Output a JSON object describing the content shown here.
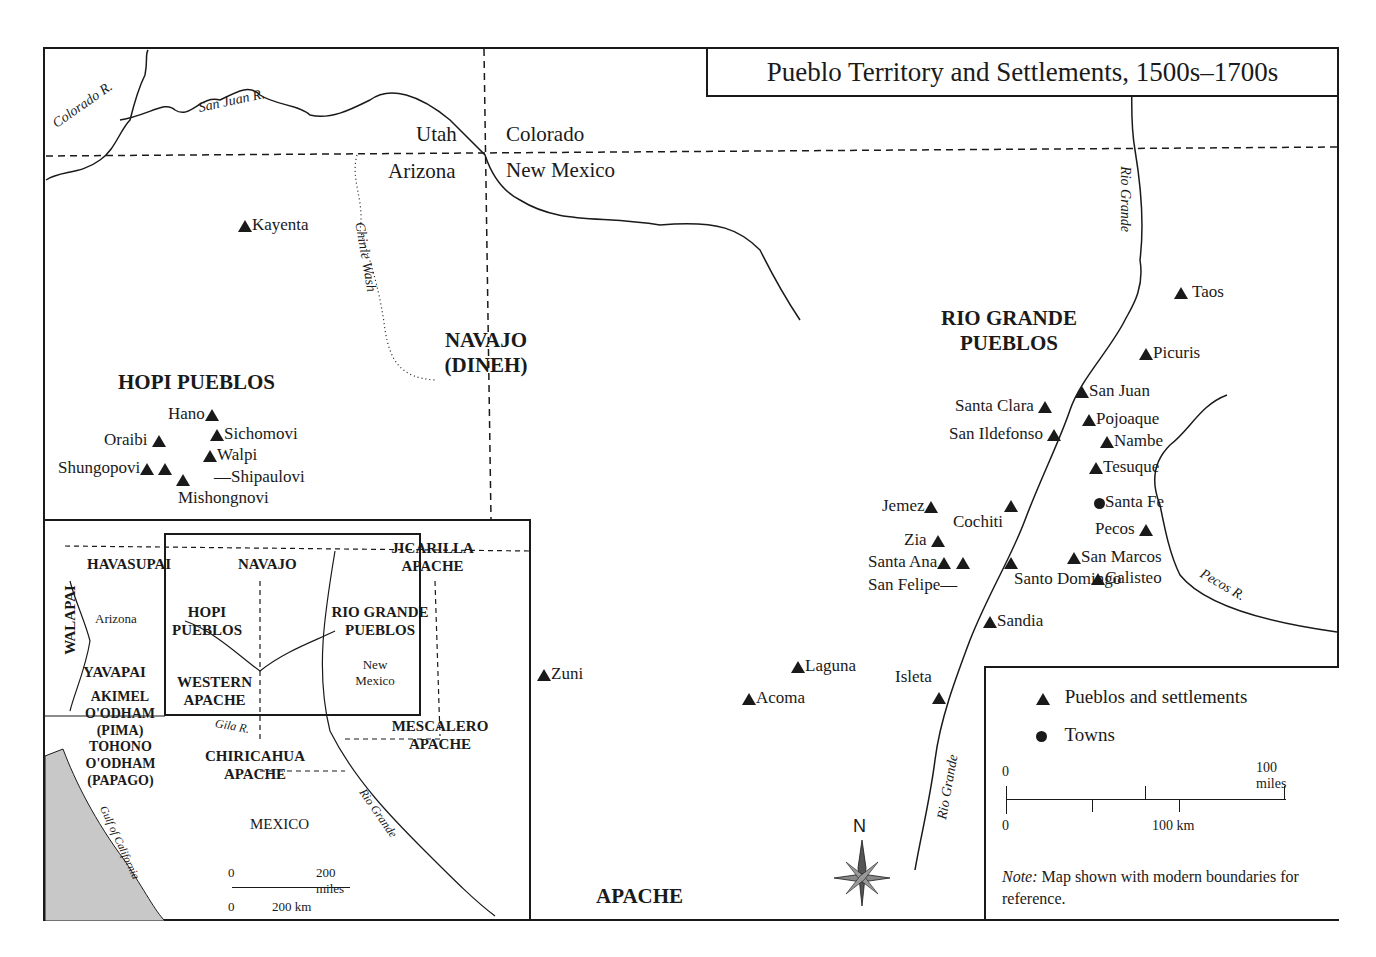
{
  "title": "Pueblo Territory and Settlements, 1500s–1700s",
  "states": {
    "utah": "Utah",
    "colorado": "Colorado",
    "arizona": "Arizona",
    "new_mexico": "New Mexico"
  },
  "rivers": {
    "colorado": "Colorado R.",
    "san_juan": "San Juan R.",
    "chinle": "Chinle Wash",
    "rio_grande_north": "Rio Grande",
    "rio_grande_south": "Rio Grande",
    "pecos": "Pecos R."
  },
  "regions": {
    "hopi": "HOPI PUEBLOS",
    "navajo": "NAVAJO (DINEH)",
    "rio_grande": "RIO GRANDE PUEBLOS",
    "apache": "APACHE"
  },
  "settlements": [
    {
      "name": "Kayenta",
      "type": "pueblo"
    },
    {
      "name": "Hano",
      "type": "pueblo"
    },
    {
      "name": "Sichomovi",
      "type": "pueblo"
    },
    {
      "name": "Oraibi",
      "type": "pueblo"
    },
    {
      "name": "Walpi",
      "type": "pueblo"
    },
    {
      "name": "Shungopovi",
      "type": "pueblo"
    },
    {
      "name": "Shipaulovi",
      "type": "pueblo"
    },
    {
      "name": "Mishongnovi",
      "type": "pueblo"
    },
    {
      "name": "Zuni",
      "type": "pueblo"
    },
    {
      "name": "Laguna",
      "type": "pueblo"
    },
    {
      "name": "Acoma",
      "type": "pueblo"
    },
    {
      "name": "Isleta",
      "type": "pueblo"
    },
    {
      "name": "Taos",
      "type": "pueblo"
    },
    {
      "name": "Picuris",
      "type": "pueblo"
    },
    {
      "name": "San Juan",
      "type": "pueblo"
    },
    {
      "name": "Santa Clara",
      "type": "pueblo"
    },
    {
      "name": "Pojoaque",
      "type": "pueblo"
    },
    {
      "name": "San Ildefonso",
      "type": "pueblo"
    },
    {
      "name": "Nambe",
      "type": "pueblo"
    },
    {
      "name": "Tesuque",
      "type": "pueblo"
    },
    {
      "name": "Santa Fe",
      "type": "town"
    },
    {
      "name": "Jemez",
      "type": "pueblo"
    },
    {
      "name": "Cochiti",
      "type": "pueblo"
    },
    {
      "name": "Pecos",
      "type": "pueblo"
    },
    {
      "name": "Zia",
      "type": "pueblo"
    },
    {
      "name": "Santa Ana",
      "type": "pueblo"
    },
    {
      "name": "San Felipe",
      "type": "pueblo"
    },
    {
      "name": "Santo Domingo",
      "type": "pueblo"
    },
    {
      "name": "San Marcos",
      "type": "pueblo"
    },
    {
      "name": "Galisteo",
      "type": "pueblo"
    },
    {
      "name": "Sandia",
      "type": "pueblo"
    }
  ],
  "inset": {
    "labels": {
      "havasupai": "HAVASUPAI",
      "navajo": "NAVAJO",
      "jicarilla": "JICARILLA APACHE",
      "walapai": "WALAPAI",
      "arizona": "Arizona",
      "hopi": "HOPI PUEBLOS",
      "rio_grande": "RIO GRANDE PUEBLOS",
      "new_mexico": "New Mexico",
      "yavapai": "YAVAPAI",
      "western_apache": "WESTERN APACHE",
      "akimel": "AKIMEL O'ODHAM (PIMA)",
      "gila": "Gila R.",
      "tohono": "TOHONO O'ODHAM (PAPAGO)",
      "chiricahua": "CHIRICAHUA APACHE",
      "mescalero": "MESCALERO APACHE",
      "mexico": "MEXICO",
      "rio_grande_river": "Rio Grande",
      "gulf": "Gulf of California"
    },
    "scale": {
      "zero_top": "0",
      "miles": "200 miles",
      "zero_bottom": "0",
      "km": "200 km"
    }
  },
  "legend": {
    "pueblos": "Pueblos and settlements",
    "towns": "Towns",
    "scale": {
      "zero_top": "0",
      "miles": "100 miles",
      "zero_bottom": "0",
      "km": "100 km"
    },
    "note_label": "Note:",
    "note_text": " Map shown with modern boundaries for reference."
  },
  "compass": {
    "north": "N"
  }
}
